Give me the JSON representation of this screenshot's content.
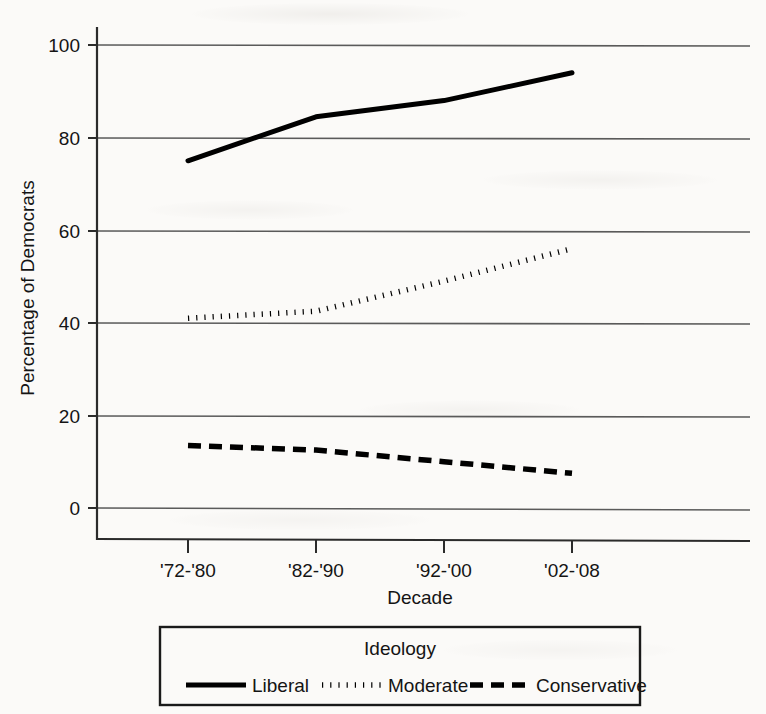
{
  "chart_data": {
    "type": "line",
    "title": "",
    "xlabel": "Decade",
    "ylabel": "Percentage of Democrats",
    "categories": [
      "'72-'80",
      "'82-'90",
      "'92-'00",
      "'02-'08"
    ],
    "ylim": [
      0,
      100
    ],
    "yticks": [
      0,
      20,
      40,
      60,
      80,
      100
    ],
    "grid": "horizontal",
    "legend_position": "bottom",
    "legend_title": "Ideology",
    "series": [
      {
        "name": "Liberal",
        "style": "solid",
        "color": "#000000",
        "values": [
          75,
          84.5,
          88,
          94
        ]
      },
      {
        "name": "Moderate",
        "style": "dotted",
        "color": "#000000",
        "values": [
          41,
          42.5,
          49,
          56
        ]
      },
      {
        "name": "Conservative",
        "style": "dashed",
        "color": "#000000",
        "values": [
          13.5,
          12.5,
          10,
          7.5
        ]
      }
    ]
  },
  "axes": {
    "y_title": "Percentage of Democrats",
    "x_title": "Decade",
    "y_tick_labels": [
      "100",
      "80",
      "60",
      "40",
      "20",
      "0"
    ],
    "x_tick_labels": [
      "'72-'80",
      "'82-'90",
      "'92-'00",
      "'02-'08"
    ]
  },
  "legend": {
    "title": "Ideology",
    "entries": [
      {
        "label": "Liberal",
        "style": "solid"
      },
      {
        "label": "Moderate",
        "style": "dotted"
      },
      {
        "label": "Conservative",
        "style": "dashed"
      }
    ]
  },
  "colors": {
    "ink": "#000000",
    "gridline": "#5a5a5a",
    "axis": "#2b2b2b",
    "page": "#fbfaf8"
  }
}
